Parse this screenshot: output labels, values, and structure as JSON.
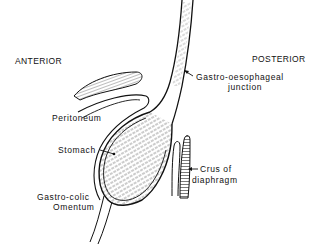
{
  "diagram": {
    "type": "anatomical line drawing",
    "orientation_labels": {
      "anterior": "ANTERIOR",
      "posterior": "POSTERIOR"
    },
    "labels": {
      "ge_junction_line1": "Gastro-oesophageal",
      "ge_junction_line2": "junction",
      "peritoneum": "Peritoneum",
      "stomach": "Stomach",
      "crus_line1": "Crus of",
      "crus_line2": "diaphragm",
      "omentum_line1": "Gastro-colic",
      "omentum_line2": "Omentum"
    },
    "colors": {
      "line": "#111111",
      "background": "#ffffff"
    }
  }
}
